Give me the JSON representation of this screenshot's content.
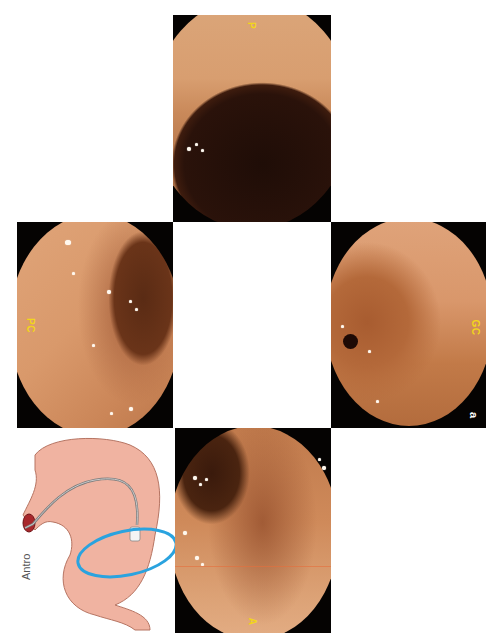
{
  "figure": {
    "letter": "a",
    "layout": "cross-shaped montage of four endoscopic views (page rotated 90°) with anatomical diagram",
    "panels": [
      {
        "id": "top",
        "label": "P",
        "description": "Posterior wall view of antrum with dark lumen toward pylorus"
      },
      {
        "id": "left",
        "label": "PC",
        "description": "Lesser curvature (pequeña curvatura) view with mucosal fold and lumen"
      },
      {
        "id": "right",
        "label": "GC",
        "description": "Greater curvature (gran curvatura) view with pylorus opening"
      },
      {
        "id": "bottom",
        "label": "A",
        "description": "Anterior wall view of antrum"
      }
    ],
    "diagram": {
      "label": "Antro",
      "description": "Stomach illustration with endoscope, antrum region circled in blue"
    }
  },
  "colors": {
    "label_yellow": "#f2d51c",
    "mucosa": "#d38f5e",
    "lumen": "#2a120a",
    "ellipse_blue": "#2aa3df",
    "stomach_pink": "#f0b3a1"
  }
}
